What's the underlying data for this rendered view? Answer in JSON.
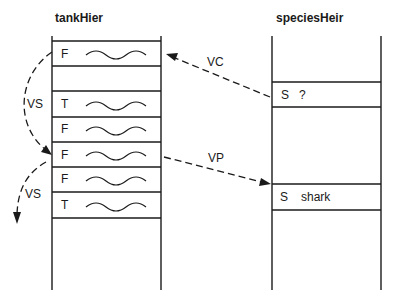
{
  "stacks": [
    {
      "id": "tank",
      "title": "tankHier",
      "rows": [
        {
          "tag": "F",
          "value": "~"
        },
        {
          "tag": "",
          "value": ""
        },
        {
          "tag": "T",
          "value": "~"
        },
        {
          "tag": "F",
          "value": "~"
        },
        {
          "tag": "F",
          "value": "~"
        },
        {
          "tag": "F",
          "value": "~"
        },
        {
          "tag": "T",
          "value": "~"
        }
      ]
    },
    {
      "id": "species",
      "title": "speciesHeir",
      "rows": [
        {
          "tag": "S",
          "value": "?"
        },
        {
          "tag": "S",
          "value": "shark"
        }
      ]
    }
  ],
  "arrows": [
    {
      "label": "VS",
      "from": "tank.row0",
      "to": "tank.row4",
      "style": "dashed-curve"
    },
    {
      "label": "VS",
      "from": "tank.row4",
      "to": "below",
      "style": "dashed-curve"
    },
    {
      "label": "VC",
      "from": "species.row0",
      "to": "tank.row0",
      "style": "dashed"
    },
    {
      "label": "VP",
      "from": "tank.row4",
      "to": "species.row1",
      "style": "dashed"
    }
  ]
}
